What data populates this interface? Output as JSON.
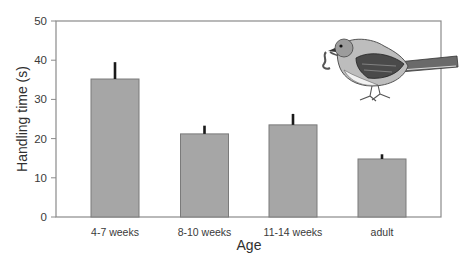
{
  "chart_data": {
    "type": "bar",
    "title": "",
    "xlabel": "Age",
    "ylabel": "Handling time (s)",
    "categories": [
      "4-7 weeks",
      "8-10 weeks",
      "11-14 weeks",
      "adult"
    ],
    "values": [
      35.2,
      21.2,
      23.5,
      14.8
    ],
    "error_upper": [
      39.5,
      23.3,
      26.3,
      16.0
    ],
    "ylim": [
      0,
      50
    ],
    "yticks": [
      0,
      10,
      20,
      30,
      40,
      50
    ],
    "grid": false,
    "legend": null,
    "bar_color": "#a6a6a6",
    "bar_edge_color": "#7a7a7a",
    "error_bar_color": "#1a1a1a",
    "axis_color": "#8a8a8a",
    "annotation": "bird-illustration (songbird holding a worm)"
  }
}
